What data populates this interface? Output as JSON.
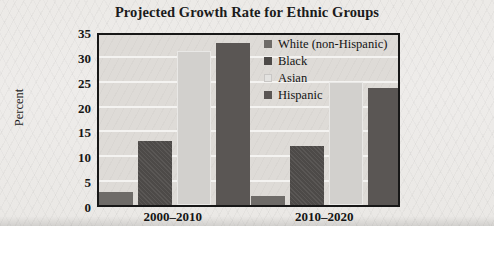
{
  "chart_data": {
    "type": "bar",
    "title": "Projected Growth Rate for Ethnic Groups",
    "xlabel": "",
    "ylabel": "Percent",
    "categories": [
      "2000–2010",
      "2010–2020"
    ],
    "series": [
      {
        "name": "White (non-Hispanic)",
        "color": "#6e6b68",
        "values": [
          2.6,
          1.8
        ]
      },
      {
        "name": "Black",
        "color": "#4d4a48",
        "values": [
          13.3,
          12.3
        ]
      },
      {
        "name": "Asian",
        "color": "#d2d0cd",
        "values": [
          32.0,
          25.4
        ]
      },
      {
        "name": "Hispanic",
        "color": "#5a5654",
        "values": [
          33.6,
          24.3
        ]
      }
    ],
    "ylim": [
      0,
      35
    ],
    "yticks": [
      0,
      5,
      10,
      15,
      20,
      25,
      30,
      35
    ],
    "ytick_labels": [
      "0",
      "5",
      "10",
      "15",
      "20",
      "25",
      "30",
      "35"
    ],
    "grid": true,
    "legend_position": "top-right",
    "plot_background": "#dedbd7",
    "gridline_color": "#f4f3f1",
    "axis_color": "#171717",
    "page_background": "#eceae7"
  }
}
